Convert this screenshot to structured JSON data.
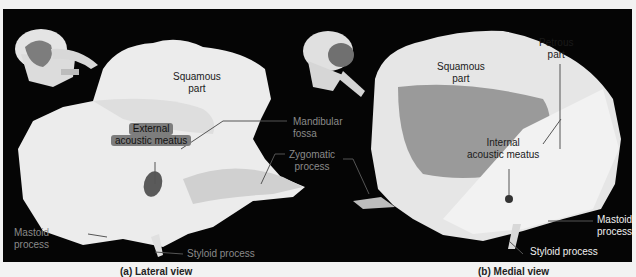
{
  "figure": {
    "panel_a": {
      "caption": "(a) Lateral view",
      "labels": {
        "squamous_part": [
          "Squamous",
          "part"
        ],
        "external_acoustic_meatus": [
          "External",
          "acoustic meatus"
        ],
        "mandibular_fossa": [
          "Mandibular",
          "fossa"
        ],
        "zygomatic_process": [
          "Zygomatic",
          "process"
        ],
        "mastoid_process": [
          "Mastoid",
          "process"
        ],
        "styloid_process": "Styloid process"
      }
    },
    "panel_b": {
      "caption": "(b) Medial view",
      "labels": {
        "squamous_part": [
          "Squamous",
          "part"
        ],
        "petrous_part": [
          "Petrous",
          "part"
        ],
        "internal_acoustic_meatus": [
          "Internal",
          "acoustic meatus"
        ],
        "mastoid_process": [
          "Mastoid",
          "process"
        ],
        "styloid_process": "Styloid process"
      }
    },
    "colors": {
      "background": "#050505",
      "bone": "#e9e9e9",
      "highlight": "#7a7a7a",
      "label_grey": "#8a8a8a"
    }
  }
}
